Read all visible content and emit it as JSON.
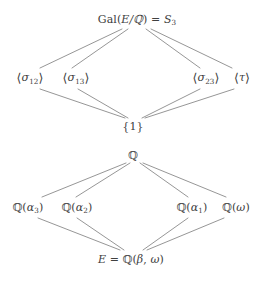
{
  "figure": {
    "type": "lattice-diagram",
    "line_color": "#8a8a8a",
    "text_color": "#404040",
    "background": "#ffffff"
  },
  "group_lattice": {
    "name": "subgroup-lattice",
    "top": {
      "id": "galois-group",
      "label": "Gal(E/ℚ) = S₃",
      "parts": {
        "gal": "Gal(",
        "field_ext": "E/ℚ",
        "close": ")",
        "equals": " = ",
        "sym": "S",
        "sym_sub": "3"
      },
      "x": 137,
      "y": 19
    },
    "middle": [
      {
        "id": "sigma12",
        "label": "⟨σ₁₂⟩",
        "sym": "σ",
        "sub": "12",
        "x": 30,
        "y": 78
      },
      {
        "id": "sigma13",
        "label": "⟨σ₁₃⟩",
        "sym": "σ",
        "sub": "13",
        "x": 76,
        "y": 78
      },
      {
        "id": "sigma23",
        "label": "⟨σ₂₃⟩",
        "sym": "σ",
        "sub": "23",
        "x": 206,
        "y": 78
      },
      {
        "id": "tau",
        "label": "⟨τ⟩",
        "sym": "τ",
        "sub": "",
        "x": 242,
        "y": 78
      }
    ],
    "bottom": {
      "id": "trivial-group",
      "label": "{1}",
      "x": 133,
      "y": 126
    },
    "edges": [
      {
        "from": "galois-group",
        "to": "sigma12"
      },
      {
        "from": "galois-group",
        "to": "sigma13"
      },
      {
        "from": "galois-group",
        "to": "sigma23"
      },
      {
        "from": "galois-group",
        "to": "tau"
      },
      {
        "from": "sigma12",
        "to": "trivial-group"
      },
      {
        "from": "sigma13",
        "to": "trivial-group"
      },
      {
        "from": "sigma23",
        "to": "trivial-group"
      },
      {
        "from": "tau",
        "to": "trivial-group"
      }
    ]
  },
  "field_lattice": {
    "name": "subfield-lattice",
    "top": {
      "id": "rationals",
      "label": "ℚ",
      "x": 133,
      "y": 155
    },
    "middle": [
      {
        "id": "q-alpha3",
        "label": "ℚ(α₃)",
        "sym": "α",
        "sub": "3",
        "x": 28,
        "y": 207
      },
      {
        "id": "q-alpha2",
        "label": "ℚ(α₂)",
        "sym": "α",
        "sub": "2",
        "x": 77,
        "y": 207
      },
      {
        "id": "q-alpha1",
        "label": "ℚ(α₁)",
        "sym": "α",
        "sub": "1",
        "x": 192,
        "y": 207
      },
      {
        "id": "q-omega",
        "label": "ℚ(ω)",
        "sym": "ω",
        "sub": "",
        "x": 236,
        "y": 207
      }
    ],
    "bottom": {
      "id": "splitting-field",
      "label": "E = ℚ(β, ω)",
      "parts": {
        "e": "E",
        "equals": " = ",
        "q": "ℚ(",
        "beta": "β",
        "comma": ", ",
        "omega": "ω",
        "close": ")"
      },
      "x": 131,
      "y": 259
    },
    "edges": [
      {
        "from": "rationals",
        "to": "q-alpha3"
      },
      {
        "from": "rationals",
        "to": "q-alpha2"
      },
      {
        "from": "rationals",
        "to": "q-alpha1"
      },
      {
        "from": "rationals",
        "to": "q-omega"
      },
      {
        "from": "q-alpha3",
        "to": "splitting-field"
      },
      {
        "from": "q-alpha2",
        "to": "splitting-field"
      },
      {
        "from": "q-alpha1",
        "to": "splitting-field"
      },
      {
        "from": "q-omega",
        "to": "splitting-field"
      }
    ]
  }
}
